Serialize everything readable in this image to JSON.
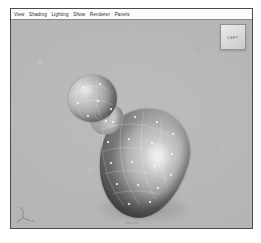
{
  "window": {
    "background_color": "#ffffff",
    "border_color": "#4a4a4a"
  },
  "menubar": {
    "background_color": "#fbfbfb",
    "items": [
      {
        "label": "View"
      },
      {
        "label": "Shading"
      },
      {
        "label": "Lighting"
      },
      {
        "label": "Show"
      },
      {
        "label": "Renderer"
      },
      {
        "label": "Panels"
      }
    ]
  },
  "viewport": {
    "background_color": "#b5b5b5",
    "camera_label": "persp",
    "view_cube": {
      "icon": "view-cube-icon",
      "label": "LEFT"
    },
    "axis_tripod": {
      "icon": "axis-tripod-icon",
      "x_label": "x",
      "y_label": "y",
      "z_label": "z"
    },
    "model": {
      "name": "budding-blob-model",
      "shading": "smooth-shaded",
      "parts": [
        {
          "name": "main-body"
        },
        {
          "name": "neck"
        },
        {
          "name": "bud"
        }
      ],
      "surface_color": "#b4b4b4",
      "wireframe_color": "#f5f5f5",
      "cv_color": "#f4f4f4",
      "cv_points": [
        {
          "x": 101,
          "y": 101
        },
        {
          "x": 123,
          "y": 96
        },
        {
          "x": 145,
          "y": 101
        },
        {
          "x": 161,
          "y": 113
        },
        {
          "x": 96,
          "y": 121
        },
        {
          "x": 117,
          "y": 118
        },
        {
          "x": 140,
          "y": 122
        },
        {
          "x": 160,
          "y": 133
        },
        {
          "x": 99,
          "y": 142
        },
        {
          "x": 120,
          "y": 141
        },
        {
          "x": 143,
          "y": 145
        },
        {
          "x": 159,
          "y": 154
        },
        {
          "x": 105,
          "y": 163
        },
        {
          "x": 126,
          "y": 164
        },
        {
          "x": 146,
          "y": 167
        },
        {
          "x": 117,
          "y": 183
        },
        {
          "x": 138,
          "y": 181
        },
        {
          "x": 71,
          "y": 66
        },
        {
          "x": 88,
          "y": 63
        },
        {
          "x": 66,
          "y": 82
        },
        {
          "x": 86,
          "y": 80
        },
        {
          "x": 99,
          "y": 88
        },
        {
          "x": 76,
          "y": 95
        },
        {
          "x": 94,
          "y": 100
        }
      ]
    }
  }
}
